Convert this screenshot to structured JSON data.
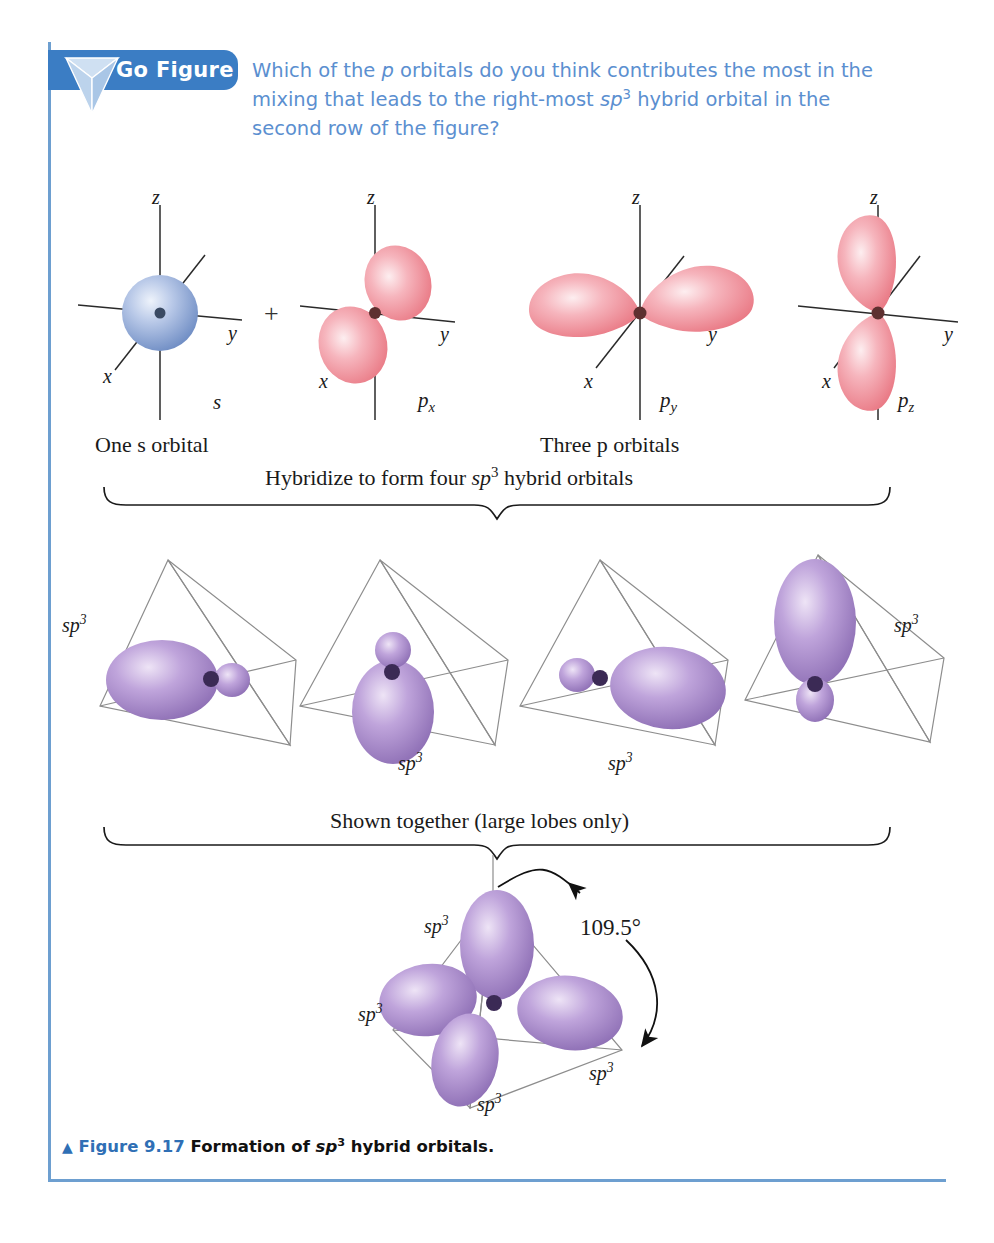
{
  "go_figure": {
    "badge_label": "Go Figure",
    "badge_icon": "inverted-tetrahedron-icon",
    "question_part1": "Which of the ",
    "question_italic1": "p",
    "question_part2": " orbitals do you think contributes the most in the mixing that leads to the right-most ",
    "question_italic2": "sp",
    "question_sup2": "3",
    "question_part3": " hybrid orbital in the second row of the figure?",
    "accent_color": "#3b7dc4",
    "text_color": "#5b8fd0"
  },
  "figure": {
    "border_color": "#6d9fd0",
    "caption_triangle": "▲",
    "caption_figure_word": "Figure",
    "caption_number": "9.17",
    "caption_text_before": "Formation of ",
    "caption_italic": "sp",
    "caption_sup": "3",
    "caption_text_after": " hybrid orbitals."
  },
  "row1": {
    "group_label_left": "One s orbital",
    "group_label_right": "Three p orbitals",
    "plus_sign": "+",
    "orbitals": [
      {
        "name": "s",
        "type": "sphere",
        "color": "#8fa9d8",
        "axes": {
          "z": "z",
          "y": "y",
          "x": "x"
        }
      },
      {
        "name": "p",
        "subscript": "x",
        "type": "p-orbital",
        "orientation": "diagonal",
        "color": "#f3909a",
        "axes": {
          "z": "z",
          "y": "y",
          "x": "x"
        }
      },
      {
        "name": "p",
        "subscript": "y",
        "type": "p-orbital",
        "orientation": "horizontal",
        "color": "#f3909a",
        "axes": {
          "z": "z",
          "y": "y",
          "x": "x"
        }
      },
      {
        "name": "p",
        "subscript": "z",
        "type": "p-orbital",
        "orientation": "vertical",
        "color": "#f3909a",
        "axes": {
          "z": "z",
          "y": "y",
          "x": "x"
        }
      }
    ]
  },
  "brace1": {
    "label_before": "Hybridize to form four ",
    "label_italic": "sp",
    "label_sup": "3",
    "label_after": " hybrid orbitals"
  },
  "row2": {
    "hybrid_color": "#9a7cc0",
    "tetrahedron_color": "#8a8a8a",
    "orbitals": [
      {
        "label": "sp",
        "sup": "3",
        "direction": "left",
        "label_position": "upper-left"
      },
      {
        "label": "sp",
        "sup": "3",
        "direction": "down",
        "label_position": "below-right"
      },
      {
        "label": "sp",
        "sup": "3",
        "direction": "right",
        "label_position": "below-left"
      },
      {
        "label": "sp",
        "sup": "3",
        "direction": "up",
        "label_position": "upper-right"
      }
    ]
  },
  "brace2": {
    "label": "Shown together (large lobes only)"
  },
  "row3": {
    "angle_label": "109.5°",
    "hybrid_color": "#9a7cc0",
    "labels": [
      {
        "label": "sp",
        "sup": "3",
        "position": "upper-left"
      },
      {
        "label": "sp",
        "sup": "3",
        "position": "mid-left"
      },
      {
        "label": "sp",
        "sup": "3",
        "position": "bottom-center"
      },
      {
        "label": "sp",
        "sup": "3",
        "position": "bottom-right"
      }
    ]
  }
}
